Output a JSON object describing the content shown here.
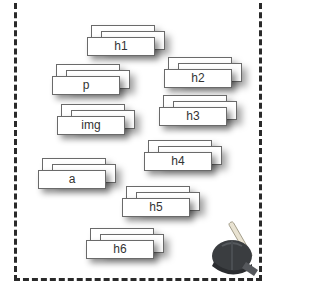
{
  "diagram": {
    "border_style": "dashed",
    "stacks": [
      {
        "label": "h1",
        "left": 87,
        "top": 25
      },
      {
        "label": "p",
        "left": 52,
        "top": 64
      },
      {
        "label": "h2",
        "left": 164,
        "top": 57
      },
      {
        "label": "h3",
        "left": 159,
        "top": 95
      },
      {
        "label": "img",
        "left": 57,
        "top": 104
      },
      {
        "label": "h4",
        "left": 144,
        "top": 140
      },
      {
        "label": "a",
        "left": 38,
        "top": 158
      },
      {
        "label": "h5",
        "left": 122,
        "top": 186
      },
      {
        "label": "h6",
        "left": 86,
        "top": 228
      }
    ],
    "icon": "hard-hat-hammer-icon"
  }
}
